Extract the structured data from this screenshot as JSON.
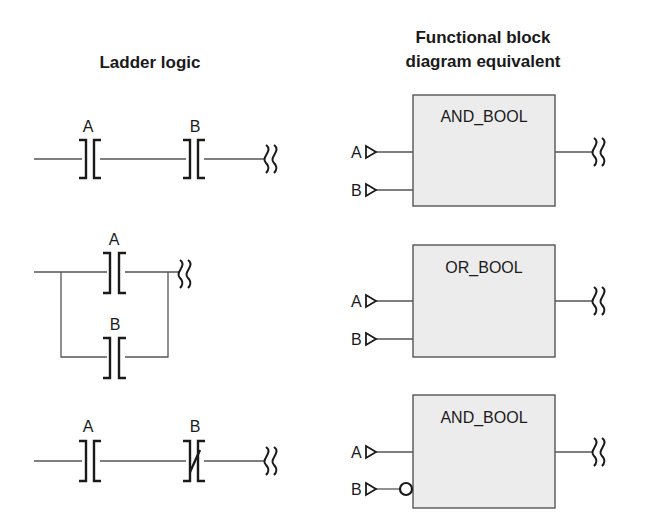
{
  "headings": {
    "ladder": "Ladder logic",
    "fbd_line1": "Functional block",
    "fbd_line2": "diagram equivalent"
  },
  "rows": [
    {
      "ladder": {
        "topology": "series",
        "contacts": [
          {
            "label": "A",
            "type": "normally-open"
          },
          {
            "label": "B",
            "type": "normally-open"
          }
        ]
      },
      "fbd": {
        "block": "AND_BOOL",
        "inputs": [
          {
            "label": "A",
            "negated": false
          },
          {
            "label": "B",
            "negated": false
          }
        ]
      }
    },
    {
      "ladder": {
        "topology": "parallel",
        "contacts": [
          {
            "label": "A",
            "type": "normally-open"
          },
          {
            "label": "B",
            "type": "normally-open"
          }
        ]
      },
      "fbd": {
        "block": "OR_BOOL",
        "inputs": [
          {
            "label": "A",
            "negated": false
          },
          {
            "label": "B",
            "negated": false
          }
        ]
      }
    },
    {
      "ladder": {
        "topology": "series",
        "contacts": [
          {
            "label": "A",
            "type": "normally-open"
          },
          {
            "label": "B",
            "type": "normally-closed"
          }
        ]
      },
      "fbd": {
        "block": "AND_BOOL",
        "inputs": [
          {
            "label": "A",
            "negated": false
          },
          {
            "label": "B",
            "negated": true
          }
        ]
      }
    }
  ],
  "colors": {
    "block_fill": "#ececec",
    "line": "#555555",
    "text": "#1a1a1a"
  }
}
